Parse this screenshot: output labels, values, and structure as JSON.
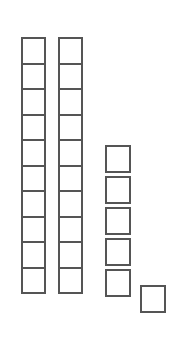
{
  "canvas": {
    "width": 178,
    "height": 337,
    "background_color": "#ffffff"
  },
  "style": {
    "square_border_color": "#555555",
    "square_fill_color": "#ffffff",
    "square_border_width_px": 2
  },
  "diagram": {
    "kind": "base-ten-unit-squares",
    "total_squares": 26,
    "groups": [
      {
        "name": "rod-column-1",
        "layout": "contiguous-vertical-rod",
        "count": 10,
        "left_px": 21,
        "top_px": 37,
        "square_width_px": 25,
        "square_height_px": 27.5
      },
      {
        "name": "rod-column-2",
        "layout": "contiguous-vertical-rod",
        "count": 10,
        "left_px": 58,
        "top_px": 37,
        "square_width_px": 25,
        "square_height_px": 27.5
      },
      {
        "name": "loose-stack-column-3",
        "layout": "spaced-vertical-stack",
        "count": 5,
        "left_px": 105,
        "top_px": 145,
        "square_width_px": 26,
        "square_height_px": 28,
        "gap_px": 3
      },
      {
        "name": "single-unit-square",
        "layout": "single",
        "count": 1,
        "left_px": 140,
        "top_px": 285,
        "square_width_px": 26,
        "square_height_px": 28
      }
    ]
  }
}
